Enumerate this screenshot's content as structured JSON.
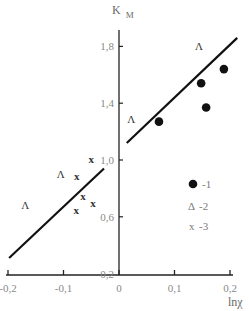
{
  "chart_data": {
    "type": "scatter",
    "title": "",
    "xlabel": "lnχ",
    "ylabel": "K_M",
    "ylabel_main": "K",
    "ylabel_sub": "M",
    "xlim": [
      -0.2,
      0.2
    ],
    "ylim": [
      0.2,
      1.9
    ],
    "grid": false,
    "legend_position": "right-middle",
    "x_ticks": [
      -0.2,
      -0.1,
      0,
      0.1,
      0.2
    ],
    "x_tick_labels": [
      "-0,2",
      "-0,1",
      "0",
      "0,1",
      "0,2"
    ],
    "y_ticks": [
      0.2,
      0.6,
      1.0,
      1.4,
      1.8
    ],
    "y_tick_labels": [
      "0,2",
      "0,6",
      "1,0",
      "1,4",
      "1,8"
    ],
    "series": [
      {
        "name": "1",
        "legend_label": "-1",
        "marker": "filled-circle",
        "points": [
          [
            0.072,
            1.27
          ],
          [
            0.148,
            1.54
          ],
          [
            0.157,
            1.37
          ],
          [
            0.189,
            1.64
          ]
        ]
      },
      {
        "name": "2",
        "legend_label": "-2",
        "legend_glyph": "Δ",
        "marker": "triangle",
        "marker_glyph": "Λ",
        "points": [
          [
            0.144,
            1.8
          ],
          [
            0.022,
            1.29
          ],
          [
            -0.105,
            0.9
          ],
          [
            -0.169,
            0.68
          ]
        ]
      },
      {
        "name": "3",
        "legend_label": "-3",
        "legend_glyph": "x",
        "marker": "x",
        "marker_glyph": "x",
        "points": [
          [
            -0.05,
            1.01
          ],
          [
            -0.076,
            0.89
          ],
          [
            -0.065,
            0.75
          ],
          [
            -0.047,
            0.7
          ],
          [
            -0.077,
            0.65
          ]
        ]
      }
    ],
    "fit_lines": [
      {
        "name": "fit-upper",
        "from": [
          0.014,
          1.12
        ],
        "to": [
          0.213,
          1.86
        ]
      },
      {
        "name": "fit-lower",
        "from": [
          -0.198,
          0.31
        ],
        "to": [
          -0.027,
          0.94
        ]
      }
    ]
  }
}
